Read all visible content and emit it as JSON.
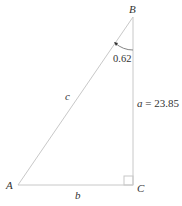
{
  "diagram": {
    "type": "right-triangle",
    "vertices": {
      "A": {
        "label": "A"
      },
      "B": {
        "label": "B"
      },
      "C": {
        "label": "C"
      }
    },
    "sides": {
      "a": {
        "label": "a",
        "value_text": " = 23.85"
      },
      "b": {
        "label": "b"
      },
      "c": {
        "label": "c"
      }
    },
    "angle_B": {
      "value": "0.62"
    },
    "right_angle_at": "C",
    "colors": {
      "lines": "#c8c8c8",
      "text": "#333333",
      "arc": "#555555"
    }
  }
}
